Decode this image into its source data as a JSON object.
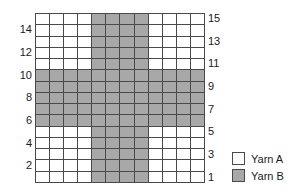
{
  "chart_data": {
    "type": "heatmap",
    "title": "",
    "subtitle": "",
    "xlabel": "",
    "ylabel": "",
    "columns": 12,
    "rows": 15,
    "grid_origin": "bottom-left",
    "row_order_top_to_bottom": [
      15,
      14,
      13,
      12,
      11,
      10,
      9,
      8,
      7,
      6,
      5,
      4,
      3,
      2,
      1
    ],
    "value_key": {
      "A": "Yarn A",
      "B": "Yarn B"
    },
    "colors": {
      "A": "#ffffff",
      "B": "#a8a8a8",
      "grid_line": "#4a4a4a",
      "text": "#1a1a1a",
      "background": "#ffffff"
    },
    "pattern_description": "Plus / cross motif: vertical bar occupies columns 5-8 on every row; horizontal bar occupies all 12 columns on rows 6-10.",
    "cells_top_to_bottom": [
      [
        "A",
        "A",
        "A",
        "A",
        "B",
        "B",
        "B",
        "B",
        "A",
        "A",
        "A",
        "A"
      ],
      [
        "A",
        "A",
        "A",
        "A",
        "B",
        "B",
        "B",
        "B",
        "A",
        "A",
        "A",
        "A"
      ],
      [
        "A",
        "A",
        "A",
        "A",
        "B",
        "B",
        "B",
        "B",
        "A",
        "A",
        "A",
        "A"
      ],
      [
        "A",
        "A",
        "A",
        "A",
        "B",
        "B",
        "B",
        "B",
        "A",
        "A",
        "A",
        "A"
      ],
      [
        "A",
        "A",
        "A",
        "A",
        "B",
        "B",
        "B",
        "B",
        "A",
        "A",
        "A",
        "A"
      ],
      [
        "B",
        "B",
        "B",
        "B",
        "B",
        "B",
        "B",
        "B",
        "B",
        "B",
        "B",
        "B"
      ],
      [
        "B",
        "B",
        "B",
        "B",
        "B",
        "B",
        "B",
        "B",
        "B",
        "B",
        "B",
        "B"
      ],
      [
        "B",
        "B",
        "B",
        "B",
        "B",
        "B",
        "B",
        "B",
        "B",
        "B",
        "B",
        "B"
      ],
      [
        "B",
        "B",
        "B",
        "B",
        "B",
        "B",
        "B",
        "B",
        "B",
        "B",
        "B",
        "B"
      ],
      [
        "B",
        "B",
        "B",
        "B",
        "B",
        "B",
        "B",
        "B",
        "B",
        "B",
        "B",
        "B"
      ],
      [
        "A",
        "A",
        "A",
        "A",
        "B",
        "B",
        "B",
        "B",
        "A",
        "A",
        "A",
        "A"
      ],
      [
        "A",
        "A",
        "A",
        "A",
        "B",
        "B",
        "B",
        "B",
        "A",
        "A",
        "A",
        "A"
      ],
      [
        "A",
        "A",
        "A",
        "A",
        "B",
        "B",
        "B",
        "B",
        "A",
        "A",
        "A",
        "A"
      ],
      [
        "A",
        "A",
        "A",
        "A",
        "B",
        "B",
        "B",
        "B",
        "A",
        "A",
        "A",
        "A"
      ],
      [
        "A",
        "A",
        "A",
        "A",
        "B",
        "B",
        "B",
        "B",
        "A",
        "A",
        "A",
        "A"
      ]
    ],
    "left_axis_label": "Row number (even rows)",
    "right_axis_label": "Row number (odd rows)",
    "left_row_labels": [
      {
        "row": 14,
        "text": "14"
      },
      {
        "row": 12,
        "text": "12"
      },
      {
        "row": 10,
        "text": "10"
      },
      {
        "row": 8,
        "text": "8"
      },
      {
        "row": 6,
        "text": "6"
      },
      {
        "row": 4,
        "text": "4"
      },
      {
        "row": 2,
        "text": "2"
      }
    ],
    "right_row_labels": [
      {
        "row": 15,
        "text": "15"
      },
      {
        "row": 13,
        "text": "13"
      },
      {
        "row": 11,
        "text": "11"
      },
      {
        "row": 9,
        "text": "9"
      },
      {
        "row": 7,
        "text": "7"
      },
      {
        "row": 5,
        "text": "5"
      },
      {
        "row": 3,
        "text": "3"
      },
      {
        "row": 1,
        "text": "1"
      }
    ],
    "legend": {
      "position": "bottom-right",
      "entries": [
        {
          "key": "A",
          "label": "Yarn A",
          "color": "#ffffff"
        },
        {
          "key": "B",
          "label": "Yarn B",
          "color": "#a8a8a8"
        }
      ]
    }
  }
}
